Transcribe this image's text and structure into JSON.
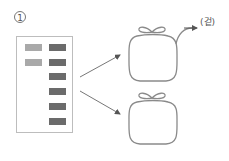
{
  "step": {
    "number": "1"
  },
  "label": {
    "outside": "(겉)"
  },
  "panel": {
    "rows": [
      {
        "light": true,
        "dark": true
      },
      {
        "light": true,
        "dark": true
      },
      {
        "light": false,
        "dark": true
      },
      {
        "light": false,
        "dark": true
      },
      {
        "light": false,
        "dark": true
      },
      {
        "light": false,
        "dark": true
      }
    ]
  },
  "colors": {
    "line": "#8a8a8a",
    "light_block": "#a9a9a9",
    "dark_block": "#6b6b6b"
  }
}
